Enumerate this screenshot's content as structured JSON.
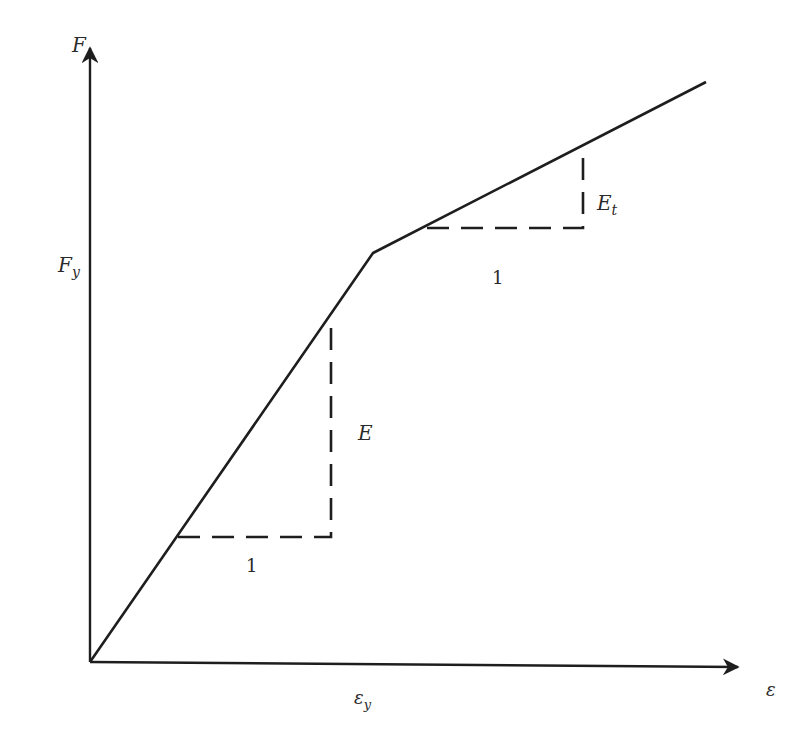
{
  "diagram": {
    "colors": {
      "line": "#1e1e1e",
      "text": "#2a2a2a",
      "background": "#ffffff"
    },
    "axes": {
      "origin": [
        90,
        662
      ],
      "y_axis": {
        "label": "F",
        "tip": [
          90,
          48
        ],
        "label_pos": [
          72,
          52
        ]
      },
      "x_axis": {
        "label": "ε",
        "tip": [
          738,
          667
        ],
        "label_pos": [
          766,
          696
        ]
      }
    },
    "curve": {
      "points": [
        [
          90,
          662
        ],
        [
          373,
          253
        ],
        [
          706,
          82
        ]
      ],
      "yield_point": [
        373,
        253
      ]
    },
    "ticks": {
      "F_y": {
        "label_main": "F",
        "label_sub": "y",
        "pos": [
          58,
          272
        ]
      },
      "eps_y": {
        "label_main": "ε",
        "label_sub": "y",
        "pos": [
          354,
          704
        ]
      }
    },
    "slope_triangles": [
      {
        "name": "elastic",
        "slope_label": "E",
        "run_label": "1",
        "points": [
          [
            178,
            537
          ],
          [
            331,
            537
          ],
          [
            331,
            316
          ]
        ],
        "slope_label_pos": [
          358,
          440
        ],
        "run_label_pos": [
          246,
          572
        ]
      },
      {
        "name": "tangent",
        "slope_label_main": "E",
        "slope_label_sub": "t",
        "run_label": "1",
        "points": [
          [
            427,
            228
          ],
          [
            583,
            228
          ],
          [
            583,
            146
          ]
        ],
        "slope_label_pos": [
          597,
          210
        ],
        "run_label_pos": [
          492,
          284
        ]
      }
    ]
  }
}
